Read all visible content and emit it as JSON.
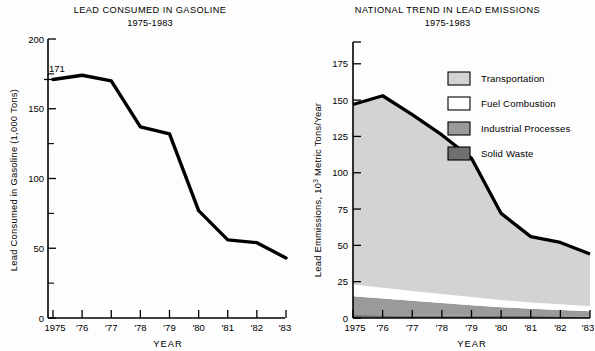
{
  "background_color": "#fdfdfd",
  "charts": [
    {
      "id": "lead-consumed-in-gasoline",
      "title_line1": "LEAD CONSUMED IN GASOLINE",
      "title_line2": "1975-1983",
      "ylabel": "Lead Consumed in Gasoline (1,000 Tons)",
      "xlabel": "YEAR",
      "annotation": "171"
    },
    {
      "id": "national-trend-in-lead-emissions",
      "title_line1": "NATIONAL TREND IN LEAD EMISSIONS",
      "title_line2": "1975-1983",
      "ylabel_pre": "Lead Emmissions, 10",
      "ylabel_sup": "3",
      "ylabel_post": " Metric Tons/Year",
      "xlabel": "YEAR"
    }
  ],
  "chart_data": [
    {
      "type": "line",
      "title": "LEAD CONSUMED IN GASOLINE 1975-1983",
      "xlabel": "YEAR",
      "ylabel": "Lead Consumed in Gasoline (1,000 Tons)",
      "x": [
        "1975",
        "'76",
        "'77",
        "'78",
        "'79",
        "'80",
        "'81",
        "'82",
        "'83"
      ],
      "x_values": [
        1975,
        1976,
        1977,
        1978,
        1979,
        1980,
        1981,
        1982,
        1983
      ],
      "values": [
        171,
        174,
        170,
        137,
        132,
        77,
        56,
        54,
        43
      ],
      "ylim": [
        0,
        200
      ],
      "yticks": [
        0,
        50,
        100,
        150,
        200
      ],
      "ytick_labels": [
        "0",
        "50",
        "100",
        "150",
        "200"
      ],
      "yminor": [
        25,
        75,
        125,
        175
      ],
      "grid": false,
      "annotations": [
        {
          "text": "171",
          "x": 1975,
          "y": 171
        }
      ],
      "series_color": "#000000"
    },
    {
      "type": "area",
      "stacked": true,
      "title": "NATIONAL TREND IN LEAD EMISSIONS 1975-1983",
      "xlabel": "YEAR",
      "ylabel": "Lead Emmissions, 10^3 Metric Tons/Year",
      "x": [
        "1975",
        "'76",
        "'77",
        "'78",
        "'79",
        "'80",
        "'81",
        "'82",
        "'83"
      ],
      "x_values": [
        1975,
        1976,
        1977,
        1978,
        1979,
        1980,
        1981,
        1982,
        1983
      ],
      "ylim": [
        0,
        190
      ],
      "yticks": [
        0,
        25,
        50,
        75,
        100,
        125,
        150,
        175
      ],
      "ytick_labels": [
        "0",
        "25",
        "50",
        "75",
        "100",
        "125",
        "150",
        "175"
      ],
      "grid": false,
      "legend_position": "upper-right",
      "series": [
        {
          "name": "Solid Waste",
          "color": "#707070",
          "values": [
            2.0,
            1.9,
            1.8,
            1.7,
            1.6,
            1.4,
            1.3,
            1.2,
            1.1
          ]
        },
        {
          "name": "Industrial Processes",
          "color": "#9a9a9a",
          "values": [
            13.0,
            11.5,
            10.0,
            8.6,
            7.2,
            6.0,
            5.0,
            4.3,
            3.6
          ]
        },
        {
          "name": "Fuel Combustion",
          "color": "#ffffff",
          "values": [
            8.0,
            7.4,
            6.8,
            6.2,
            5.6,
            5.0,
            4.4,
            3.9,
            3.4
          ]
        },
        {
          "name": "Transportation",
          "color": "#d3d3d3",
          "values": [
            124.0,
            132.2,
            121.4,
            109.5,
            95.6,
            59.6,
            45.3,
            42.6,
            35.9
          ]
        }
      ],
      "totals": [
        147,
        153,
        140,
        126,
        110,
        72,
        56,
        52,
        44
      ],
      "total_line_color": "#000000"
    }
  ],
  "legend": {
    "items": [
      {
        "label": "Transportation",
        "color": "#d3d3d3"
      },
      {
        "label": "Fuel Combustion",
        "color": "#ffffff"
      },
      {
        "label": "Industrial Processes",
        "color": "#9a9a9a"
      },
      {
        "label": "Solid Waste",
        "color": "#707070"
      }
    ]
  }
}
